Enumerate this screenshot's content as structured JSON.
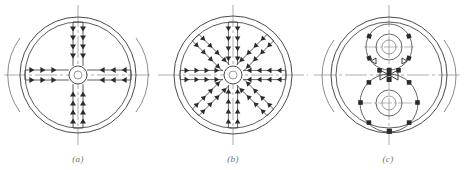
{
  "sheet": {
    "width": 466,
    "height": 170,
    "background": "#ffffff",
    "stroke_color": "#4a4a4a",
    "marker_color": "#2b2b2b",
    "centerline_color": "#8a8a8a",
    "caption_color": "#6e6e6e"
  },
  "figures": [
    {
      "id": "figure-a",
      "caption": "(a)",
      "description": "four-spoke orthogonal flow distribution disc",
      "center_x": 75,
      "center_y": 75,
      "outer_radius": 60,
      "inner_radius": 55,
      "hub_radius": 9,
      "spoke_count": 4,
      "spoke_angles_deg": [
        0,
        90,
        180,
        270
      ],
      "markers_per_spoke": 5,
      "marker_shape": "triangle",
      "marker_direction": "inward",
      "has_outer_arcs": true,
      "has_vertical_centerline": true,
      "has_horizontal_centerline": true
    },
    {
      "id": "figure-b",
      "caption": "(b)",
      "description": "eight-spoke radial flow distribution disc",
      "center_x": 233,
      "center_y": 75,
      "outer_radius": 60,
      "inner_radius": 54,
      "hub_radius": 9,
      "spoke_count": 8,
      "spoke_angles_deg": [
        0,
        45,
        90,
        135,
        180,
        225,
        270,
        315
      ],
      "markers_per_spoke": 4,
      "marker_shape": "triangle",
      "marker_direction": "inward",
      "has_outer_arcs": false,
      "has_vertical_centerline": true,
      "has_horizontal_centerline": true
    },
    {
      "id": "figure-c",
      "caption": "(c)",
      "description": "twin bolt-circle hub assembly disc",
      "center_x": 389,
      "center_y": 75,
      "outer_radius": 60,
      "inner_radius": 55,
      "has_outer_arcs": true,
      "has_vertical_centerline": true,
      "has_horizontal_centerline": true,
      "hubs": [
        {
          "name": "upper-hub",
          "cx": 389,
          "cy": 47,
          "bolt_circle_radius": 23,
          "bore_outer_radius": 13,
          "bore_inner_radius": 7,
          "bolt_count": 6,
          "bolt_start_angle_deg": 150,
          "marker_shape": "square"
        },
        {
          "name": "lower-hub",
          "cx": 389,
          "cy": 103,
          "bolt_circle_radius": 29,
          "bore_outer_radius": 13,
          "bore_inner_radius": 7,
          "bolt_count": 8,
          "bolt_start_angle_deg": 90,
          "marker_shape": "square"
        }
      ],
      "valve_symbols": [
        {
          "name": "left-valve",
          "cx": 372,
          "cy": 62
        },
        {
          "name": "right-valve",
          "cx": 406,
          "cy": 62
        },
        {
          "name": "center-bowtie",
          "cx": 389,
          "cy": 75
        }
      ]
    }
  ]
}
